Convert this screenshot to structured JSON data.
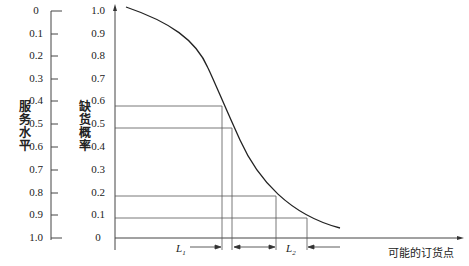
{
  "chart_data": {
    "type": "line",
    "title": "",
    "left_axis": {
      "label": "服务水平",
      "ticks": [
        "0",
        "0.1",
        "0.2",
        "0.3",
        "0.4",
        "0.5",
        "0.6",
        "0.7",
        "0.8",
        "0.9",
        "1.0"
      ]
    },
    "y_axis": {
      "label": "缺货概率",
      "ticks": [
        "1.0",
        "0.9",
        "0.8",
        "0.7",
        "0.6",
        "0.5",
        "0.4",
        "0.3",
        "0.2",
        "0.1",
        "0"
      ]
    },
    "x_axis": {
      "label": "可能的订货点"
    },
    "curve": "decreasing S-shaped curve from stockout probability ~1.0 down to ~0.05",
    "reference_lines": [
      {
        "y": 0.6
      },
      {
        "y": 0.5
      },
      {
        "y": 0.2
      },
      {
        "y": 0.1
      }
    ],
    "intervals": [
      {
        "name": "L1",
        "between_y": [
          0.6,
          0.5
        ]
      },
      {
        "name": "L2",
        "between_y": [
          0.2,
          0.1
        ]
      }
    ]
  },
  "labels": {
    "service_level": "服务水平",
    "stockout_prob": "缺货概率",
    "reorder_point": "可能的订货点",
    "L1": "L",
    "L1_sub": "1",
    "L2": "L",
    "L2_sub": "2"
  }
}
